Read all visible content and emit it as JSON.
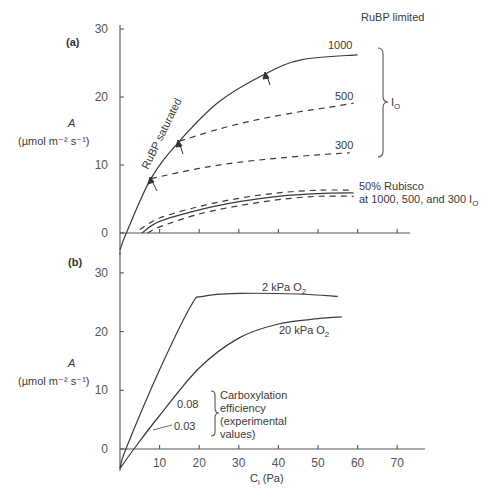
{
  "chart_data": [
    {
      "panel": "(a)",
      "type": "line",
      "title": "",
      "xlabel": "",
      "ylabel": "A",
      "ylabel_units": "(µmol m⁻² s⁻¹)",
      "xlim": [
        0,
        75
      ],
      "ylim": [
        -3,
        30
      ],
      "y_ticks": [
        0,
        10,
        20,
        30
      ],
      "x_ticks": [
        10,
        20,
        30,
        40,
        50,
        60,
        70
      ],
      "x_tick_labels_shown": false,
      "grid": false,
      "series": [
        {
          "name": "RuBP saturated / 1000 I_O",
          "style": "solid",
          "x": [
            0,
            1.6,
            7.8,
            15,
            25,
            37,
            46,
            60
          ],
          "y": [
            -2.5,
            0,
            8,
            13.5,
            19.3,
            23.5,
            25.5,
            26.2
          ]
        },
        {
          "name": "500 I_O",
          "style": "dashed",
          "x": [
            15,
            25,
            35,
            45,
            53,
            59
          ],
          "y": [
            13.5,
            15.3,
            16.7,
            17.8,
            18.5,
            19.1
          ]
        },
        {
          "name": "300 I_O",
          "style": "dashed",
          "x": [
            7.8,
            20,
            30,
            40,
            50,
            58
          ],
          "y": [
            8,
            9.5,
            10.4,
            11.0,
            11.5,
            11.8
          ]
        },
        {
          "name": "50% Rubisco 1000 I_O",
          "style": "dashed",
          "x": [
            5,
            10,
            20,
            30,
            40,
            50,
            59
          ],
          "y": [
            0.5,
            2.2,
            3.9,
            5.1,
            5.9,
            6.3,
            6.3
          ]
        },
        {
          "name": "50% Rubisco 500 I_O",
          "style": "solid",
          "x": [
            5.5,
            10,
            20,
            30,
            40,
            50,
            59
          ],
          "y": [
            0,
            1.7,
            3.4,
            4.6,
            5.4,
            5.8,
            5.9
          ]
        },
        {
          "name": "50% Rubisco 300 I_O",
          "style": "dashed",
          "x": [
            7,
            10,
            20,
            30,
            40,
            50,
            59
          ],
          "y": [
            0,
            0.9,
            2.8,
            4.0,
            4.9,
            5.4,
            5.4
          ]
        }
      ],
      "annotations": {
        "panel_label": "(a)",
        "rubp_limited": "RuBP limited",
        "rubp_saturated": "RuBP saturated",
        "label_1000": "1000",
        "label_500": "500",
        "label_300": "300",
        "io_label": "I",
        "io_sub": "O",
        "rubisco_line1": "50% Rubisco",
        "rubisco_line2": "at 1000, 500, and 300 I",
        "rubisco_sub": "O",
        "arrows_at": [
          {
            "x": 7.8,
            "y": 8
          },
          {
            "x": 15,
            "y": 13.5
          },
          {
            "x": 37,
            "y": 23.5
          }
        ]
      }
    },
    {
      "panel": "(b)",
      "type": "line",
      "title": "",
      "xlabel": "C",
      "xlabel_sub": "i",
      "xlabel_units": " (Pa)",
      "ylabel": "A",
      "ylabel_units": "(µmol m⁻² s⁻¹)",
      "xlim": [
        0,
        75
      ],
      "ylim": [
        -3.5,
        35
      ],
      "y_ticks": [
        0,
        10,
        20,
        30
      ],
      "x_ticks": [
        10,
        20,
        30,
        40,
        50,
        60,
        70
      ],
      "grid": false,
      "series": [
        {
          "name": "2 kPa O2",
          "style": "solid",
          "x": [
            0,
            1.5,
            10,
            18,
            21,
            30,
            45,
            55
          ],
          "y": [
            -3.3,
            0,
            13.5,
            24.5,
            26.0,
            26.5,
            26.4,
            26.0
          ]
        },
        {
          "name": "20 kPa O2",
          "style": "solid",
          "x": [
            0,
            3.5,
            10,
            20,
            30,
            40,
            50,
            56
          ],
          "y": [
            -3.3,
            0,
            5.7,
            13.8,
            18.9,
            21.3,
            22.2,
            22.5
          ]
        }
      ],
      "annotations": {
        "panel_label": "(b)",
        "label_2kpa": "2 kPa O",
        "label_20kpa": "20 kPa O",
        "o2_sub": "2",
        "eff_high": "0.08",
        "eff_low": "0.03",
        "carbox_lines": [
          "Carboxylation",
          "efficiency",
          "(experimental",
          "values)"
        ]
      }
    }
  ],
  "axis_text": {
    "y_ticks": [
      "0",
      "10",
      "20",
      "30"
    ],
    "x_ticks": [
      "10",
      "20",
      "30",
      "40",
      "50",
      "60",
      "70"
    ],
    "y_label": "A",
    "y_units": "(µmol m⁻² s⁻¹)",
    "x_label": "C",
    "x_label_sub": "i",
    "x_label_units": " (Pa)"
  }
}
